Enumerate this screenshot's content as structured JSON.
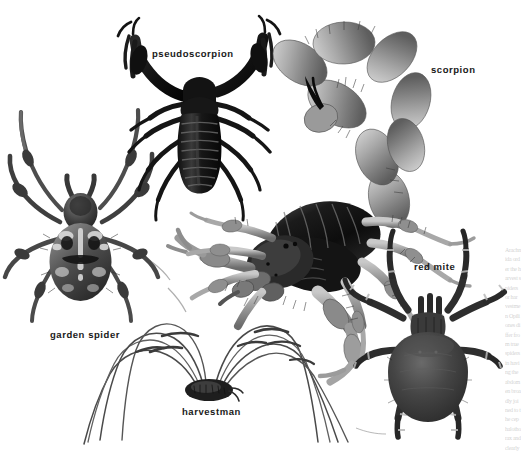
{
  "plate": {
    "title": "Arachnids",
    "width": 521,
    "height": 466,
    "background_color": "#ffffff",
    "style": "halftone black-and-white scientific illustration plate",
    "ink_color": "#1c1c1c",
    "label_color": "#1c1c1c"
  },
  "labels": {
    "pseudoscorpion": "pseudoscorpion",
    "scorpion": "scorpion",
    "garden_spider": "garden spider",
    "harvestman": "harvestman",
    "red_mite": "red mite"
  },
  "figures": [
    {
      "id": "pseudoscorpion",
      "label": "pseudoscorpion",
      "label_x": 152,
      "label_y": 50,
      "position": "upper-left-center",
      "tone": "very dark, near black",
      "description": "dorsal view; teardrop abdomen with horizontal segment bands, two long raised pedipalps ending in slender pincers, four pairs of legs"
    },
    {
      "id": "scorpion",
      "label": "scorpion",
      "label_x": 431,
      "label_y": 66,
      "position": "upper-right / center",
      "tone": "light grey tail, dark body",
      "description": "large scorpion with segmented metasoma curled forward over the body, dark telson and sting, heavy pedipalp claws, eight legs"
    },
    {
      "id": "garden-spider",
      "label": "garden spider",
      "label_x": 50,
      "label_y": 331,
      "position": "left",
      "tone": "mid grey with light folium markings",
      "description": "dorsal view; round abdomen bearing pale cross-shaped folium pattern, eight legs angled upward and outward"
    },
    {
      "id": "harvestman",
      "label": "harvestman",
      "label_x": 182,
      "label_y": 408,
      "position": "bottom-center",
      "tone": "fine line drawing, very pale legs",
      "description": "tiny compact oval body with eight extremely long thread-like legs arching up and sweeping down"
    },
    {
      "id": "red-mite",
      "label": "red mite",
      "label_x": 414,
      "label_y": 263,
      "position": "bottom-right",
      "tone": "solid dark grey",
      "description": "dorsal view; rounded unsegmented body, eight short banded legs, small palps at the front"
    }
  ],
  "margin_text": {
    "visible": true,
    "legible": false,
    "note": "sliver of cropped body text from the facing page along the right edge",
    "glyphs": "Arachnida order the harvest spiders or har vestmen Opiliones differ from true spiders in having the abdomen broadly joined to the cephalothorax and clearly segmented The body is small and compact while the legs are"
  }
}
